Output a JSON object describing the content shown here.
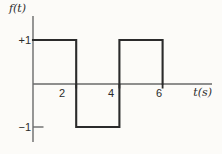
{
  "figure": {
    "background": "#fcfbf8",
    "ink_color": "#2b2b2b",
    "axis_color": "#6a6a6a",
    "ylabel": "f(t)",
    "xlabel": "t(s)"
  },
  "chart_data": {
    "type": "line",
    "subtype": "square-wave",
    "title": "",
    "xlabel": "t(s)",
    "ylabel": "f(t)",
    "x_ticks": [
      2,
      4,
      6
    ],
    "x_tick_labels": [
      "2",
      "4",
      "6"
    ],
    "y_ticks": [
      1,
      -1
    ],
    "y_tick_labels": [
      "+1",
      "−1"
    ],
    "xlim": [
      0,
      8.3
    ],
    "ylim": [
      -1.45,
      1.55
    ],
    "grid": false,
    "legend": false,
    "series": [
      {
        "name": "f(t)",
        "points": [
          [
            0,
            1
          ],
          [
            2,
            1
          ],
          [
            2,
            -1
          ],
          [
            4,
            -1
          ],
          [
            4,
            1
          ],
          [
            6,
            1
          ],
          [
            6,
            0
          ]
        ]
      }
    ]
  }
}
